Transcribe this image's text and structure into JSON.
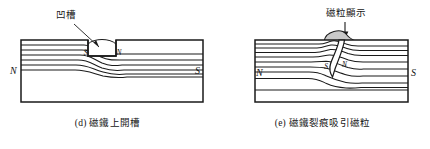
{
  "figure": {
    "title_visible": false,
    "background_color": "#ffffff",
    "line_color": "#1a1a1a",
    "particle_fill_color": "#c9c9c9",
    "panels": [
      {
        "id": "d",
        "caption": "(d) 磁鐵上開槽",
        "callout": {
          "label": "凹槽",
          "pointer": "diagonal-leader-line",
          "points_to": "groove-rectangle"
        },
        "magnet": {
          "left_pole": "N",
          "right_pole": "S",
          "shape": "rectangle"
        },
        "defect": {
          "type": "machined-groove",
          "shape": "rectangle-notch-in-top-surface",
          "inner_left_pole": "S",
          "inner_right_pole": "N"
        },
        "field_lines": {
          "count": 6,
          "behavior": "deflected downward beneath the groove"
        }
      },
      {
        "id": "e",
        "caption": "(e) 磁鐵裂痕吸引磁粒",
        "callout": {
          "label": "磁粒顯示",
          "pointer": "down-arrow",
          "points_to": "particle-buildup"
        },
        "magnet": {
          "left_pole": "N",
          "right_pole": "S",
          "shape": "rectangle"
        },
        "defect": {
          "type": "crack",
          "shape": "narrow-curved-crack-from-top-surface",
          "inner_left_pole": "S",
          "inner_right_pole": "N"
        },
        "particles": {
          "label": "磁粒顯示",
          "description": "magnetic particle buildup mounded over the crack mouth",
          "fill_color": "#c9c9c9"
        },
        "field_lines": {
          "count": 9,
          "behavior": "deflected around and above the crack"
        }
      }
    ]
  }
}
